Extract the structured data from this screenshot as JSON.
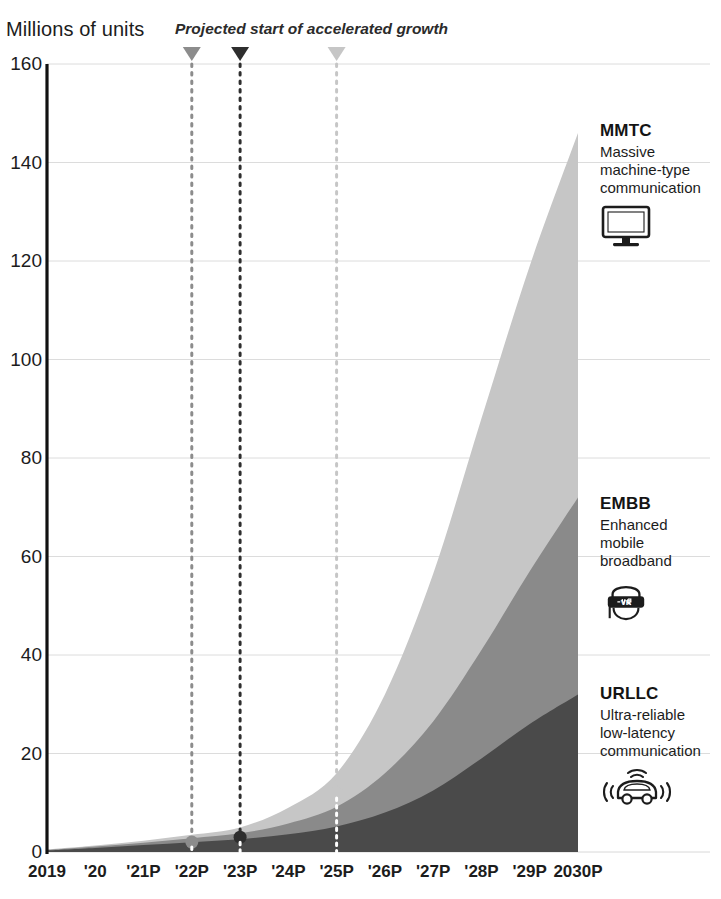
{
  "header": {
    "y_axis_unit": "Millions of units",
    "annotation": "Projected start of accelerated growth"
  },
  "legend": [
    {
      "id": "mmtc",
      "title": "MMTC",
      "description": "Massive\nmachine-type\ncommunication",
      "icon": "monitor-icon",
      "color": "#c6c6c6"
    },
    {
      "id": "embb",
      "title": "EMBB",
      "description": "Enhanced\nmobile\nbroadband",
      "icon": "vr-headset-icon",
      "color": "#8a8a8a"
    },
    {
      "id": "urllc",
      "title": "URLLC",
      "description": "Ultra-reliable\nlow-latency\ncommunication",
      "icon": "connected-car-icon",
      "color": "#4a4a4a"
    }
  ],
  "markers": [
    {
      "id": "marker-urllc",
      "x_label": "'22P",
      "x_index": 3,
      "value": 2,
      "color": "#8c8c8c"
    },
    {
      "id": "marker-embb",
      "x_label": "'23P",
      "x_index": 4,
      "value": 3,
      "color": "#2e2e2e"
    },
    {
      "id": "marker-mmtc",
      "x_label": "'25P",
      "x_index": 6,
      "value": 12,
      "color": "#c6c6c6"
    }
  ],
  "chart_data": {
    "type": "area",
    "title": "Millions of units",
    "subtitle": "Projected start of accelerated growth",
    "xlabel": "",
    "ylabel": "Millions of units",
    "stacked": true,
    "grid": true,
    "legend_position": "right",
    "ylim": [
      0,
      160
    ],
    "yticks": [
      0,
      20,
      40,
      60,
      80,
      100,
      120,
      140,
      160
    ],
    "categories": [
      "2019",
      "'20",
      "'21P",
      "'22P",
      "'23P",
      "'24P",
      "'25P",
      "'26P",
      "'27P",
      "'28P",
      "'29P",
      "2030P"
    ],
    "series": [
      {
        "name": "URLLC",
        "label": "Ultra-reliable low-latency communication",
        "color": "#4a4a4a",
        "values": [
          0.3,
          0.8,
          1.4,
          2.0,
          2.6,
          3.6,
          5.2,
          8.0,
          12.5,
          19.0,
          26.0,
          32.0
        ]
      },
      {
        "name": "EMBB",
        "label": "Enhanced mobile broadband",
        "color": "#8a8a8a",
        "values": [
          0.1,
          0.3,
          0.5,
          0.8,
          1.2,
          2.2,
          4.0,
          8.0,
          14.0,
          22.0,
          31.0,
          40.0
        ]
      },
      {
        "name": "MMTC",
        "label": "Massive machine-type communication",
        "color": "#c6c6c6",
        "values": [
          0.1,
          0.2,
          0.4,
          0.7,
          1.2,
          3.2,
          6.8,
          16.0,
          30.0,
          47.0,
          62.0,
          74.0
        ]
      }
    ],
    "totals": [
      0.5,
      1.3,
      2.3,
      3.5,
      5.0,
      9.0,
      16.0,
      32.0,
      56.5,
      88.0,
      119.0,
      146.0
    ],
    "annotations": [
      {
        "text": "Projected start of accelerated growth",
        "x_label": "'22P",
        "value": 2
      },
      {
        "text": "Projected start of accelerated growth",
        "x_label": "'23P",
        "value": 3
      },
      {
        "text": "Projected start of accelerated growth",
        "x_label": "'25P",
        "value": 12
      }
    ]
  }
}
